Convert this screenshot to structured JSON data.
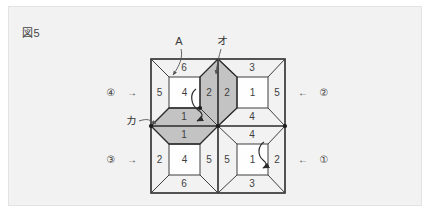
{
  "figure": {
    "caption": "図5",
    "panel_bg": "#f2f2f2",
    "line_color": "#2b2b2b",
    "thin_line_color": "#555555",
    "shade_color": "#bdbdbd",
    "face_color": "#fefefe"
  },
  "callouts": {
    "a": "A",
    "o": "オ",
    "ka": "カ"
  },
  "side_markers": {
    "left_top": {
      "label": "④",
      "arrow": "→"
    },
    "left_bottom": {
      "label": "③",
      "arrow": "→"
    },
    "right_top": {
      "label": "②",
      "arrow": "←"
    },
    "right_bottom": {
      "label": "①",
      "arrow": "←"
    }
  },
  "quadrants": {
    "top_left": {
      "center": "4",
      "top": "6",
      "left": "5",
      "right": "2",
      "bottom": "1"
    },
    "top_right": {
      "center": "1",
      "top": "3",
      "left": "2",
      "right": "5",
      "bottom": "4"
    },
    "bottom_left": {
      "center": "4",
      "top": "1",
      "left": "2",
      "right": "5",
      "bottom": "6"
    },
    "bottom_right": {
      "center": "1",
      "top": "4",
      "left": "5",
      "right": "2",
      "bottom": "3"
    }
  },
  "shaded_faces": [
    "top_left.right",
    "top_left.bottom",
    "top_right.left",
    "bottom_left.top"
  ]
}
